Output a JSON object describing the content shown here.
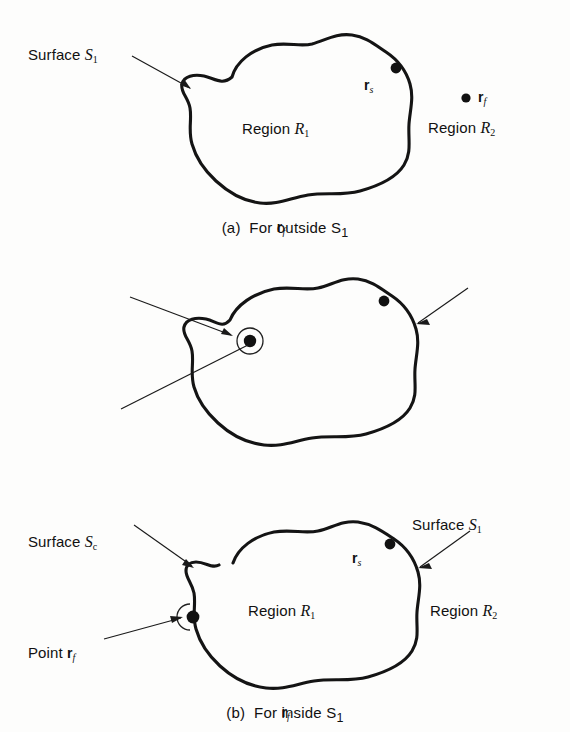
{
  "figure": {
    "type": "technical-diagram",
    "background_color": "#fdfdfc",
    "line_color": "#141414"
  },
  "panels": [
    {
      "id": "a",
      "caption_prefix": "(a)",
      "caption_text": "For",
      "caption_vector": "r",
      "caption_vector_sub": "f",
      "caption_mid": "outside",
      "caption_surface": "S",
      "caption_surface_sub": "1",
      "labels": {
        "surface_left": "Surface",
        "surface_left_sym": "S",
        "surface_left_sub": "1",
        "region_inner": "Region",
        "region_inner_sym": "R",
        "region_inner_sub": "1",
        "region_outer": "Region",
        "region_outer_sym": "R",
        "region_outer_sub": "2",
        "source_point": "r",
        "source_point_sub": "s",
        "field_point": "r",
        "field_point_sub": "f"
      }
    },
    {
      "id": "b",
      "caption_prefix": "(b)",
      "caption_text": "For",
      "caption_vector": "r",
      "caption_vector_sub": "f",
      "caption_mid": "inside",
      "caption_surface": "S",
      "caption_surface_sub": "1",
      "labels": {
        "surface_c": "Surface",
        "surface_c_sym": "S",
        "surface_c_sub": "c",
        "point_label": "Point",
        "point_vector": "r",
        "point_vector_sub": "f",
        "surface_right": "Surface",
        "surface_right_sym": "S",
        "surface_right_sub": "1",
        "region_inner": "Region",
        "region_inner_sym": "R",
        "region_inner_sub": "1",
        "region_outer": "Region",
        "region_outer_sym": "R",
        "region_outer_sub": "2",
        "source_point": "r",
        "source_point_sub": "s"
      }
    },
    {
      "id": "c",
      "caption_prefix": "(c)",
      "caption_text": "For",
      "caption_vector": "r",
      "caption_vector_sub": "f",
      "caption_mid": "on",
      "caption_surface": "S",
      "caption_surface_sub": "1",
      "labels": {
        "surface_left": "Surface",
        "surface_left_sym": "S",
        "surface_left_sub": "1",
        "point_label": "Point",
        "point_vector": "r",
        "point_vector_sub": "f",
        "surface_right": "Surface",
        "surface_right_sym": "S",
        "surface_right_sub": "1",
        "region_inner": "Region",
        "region_inner_sym": "R",
        "region_inner_sub": "1",
        "region_outer": "Region",
        "region_outer_sym": "R",
        "region_outer_sub": "2",
        "source_point": "r",
        "source_point_sub": "s"
      }
    }
  ]
}
